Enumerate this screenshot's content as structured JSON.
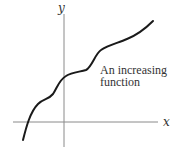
{
  "diagram": {
    "title": "",
    "x_axis_label": "x",
    "y_axis_label": "y",
    "annotation_lines": [
      "An increasing",
      "function"
    ],
    "curve_description": "increasing function with two plateau-like wiggles",
    "colors": {
      "curve": "#1a1a1a",
      "axes": "#8a8a8a",
      "text": "#333333"
    }
  }
}
